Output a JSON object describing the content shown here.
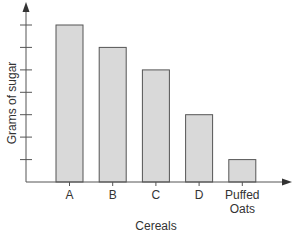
{
  "chart_data": {
    "type": "bar",
    "title": "",
    "xlabel": "Cereals",
    "ylabel": "Grams of sugar",
    "categories": [
      "A",
      "B",
      "C",
      "D",
      "Puffed Oats"
    ],
    "category_lines": [
      [
        "A"
      ],
      [
        "B"
      ],
      [
        "C"
      ],
      [
        "D"
      ],
      [
        "Puffed",
        "Oats"
      ]
    ],
    "values": [
      7,
      6,
      5,
      3,
      1
    ],
    "ylim": [
      0,
      7
    ],
    "y_ticks": [
      1,
      2,
      3,
      4,
      5,
      6,
      7
    ],
    "y_tick_labels_shown": false,
    "grid": false,
    "legend": null,
    "colors": {
      "bar_fill": "#d9d9d9",
      "bar_stroke": "#555555",
      "axis": "#555555"
    }
  }
}
